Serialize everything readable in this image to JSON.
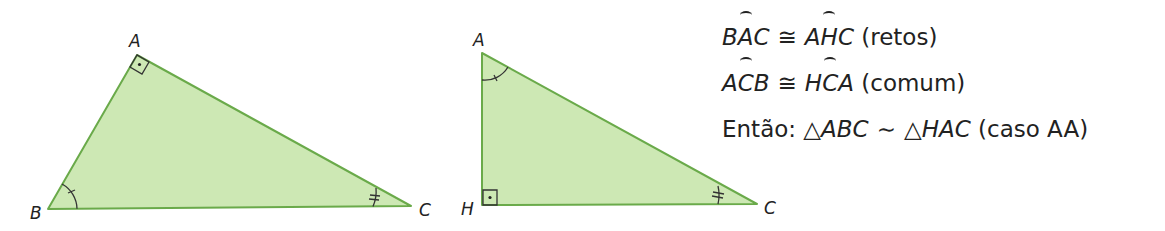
{
  "colors": {
    "fill": "#cde8b4",
    "stroke": "#6aaa4a",
    "mark": "#333333",
    "text": "#222222"
  },
  "triangle_abc": {
    "vertices": {
      "A": [
        137,
        55
      ],
      "B": [
        48,
        209
      ],
      "C": [
        411,
        206
      ]
    },
    "labels": {
      "A": "A",
      "B": "B",
      "C": "C"
    },
    "right_angle_at": "A",
    "single_tick_angle_at": "B",
    "double_tick_angle_at": "C"
  },
  "triangle_hac": {
    "vertices": {
      "A": [
        482,
        53
      ],
      "H": [
        482,
        205
      ],
      "C": [
        757,
        204
      ]
    },
    "labels": {
      "A": "A",
      "H": "H",
      "C": "C"
    },
    "right_angle_at": "H",
    "single_tick_angle_at": "A",
    "double_tick_angle_at": "C"
  },
  "equations": [
    {
      "left_pre": "B",
      "left_hat": "A",
      "left_post": "C",
      "relation": "≅",
      "right_pre": "A",
      "right_hat": "H",
      "right_post": "C",
      "note": "(retos)"
    },
    {
      "left_pre": "A",
      "left_hat": "C",
      "left_post": "B",
      "relation": "≅",
      "right_pre": "H",
      "right_hat": "C",
      "right_post": "A",
      "note": "(comum)"
    }
  ],
  "conclusion": {
    "prefix": "Então: ",
    "tri_symbol": "△",
    "left": "ABC",
    "relation": "∼",
    "right": "HAC",
    "note": "(caso AA)"
  }
}
